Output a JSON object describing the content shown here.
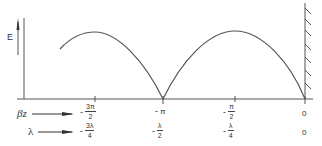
{
  "diagram": {
    "type": "standing-wave-field-diagram",
    "y_axis_label": "E",
    "boundary": "conducting-wall",
    "curve": {
      "shape": "|sin| envelope",
      "peaks_at_beta_z": [
        "-3π/2",
        "-π/2"
      ],
      "nodes_at_beta_z": [
        "-π",
        "0"
      ]
    },
    "colors": {
      "line": "#555555",
      "text": "#333333",
      "background": "#ffffff"
    }
  },
  "rows": {
    "beta_z": {
      "label": "βz",
      "ticks": [
        {
          "sign": "-",
          "num": "3π",
          "den": "2"
        },
        {
          "sign": "-",
          "whole": "π"
        },
        {
          "sign": "-",
          "num": "π",
          "den": "2"
        },
        {
          "whole": "0"
        }
      ]
    },
    "lambda": {
      "label": "λ",
      "ticks": [
        {
          "sign": "-",
          "num": "3λ",
          "den": "4"
        },
        {
          "sign": "-",
          "num": "λ",
          "den": "2"
        },
        {
          "sign": "-",
          "num": "λ",
          "den": "4"
        },
        {
          "whole": "0"
        }
      ]
    }
  }
}
